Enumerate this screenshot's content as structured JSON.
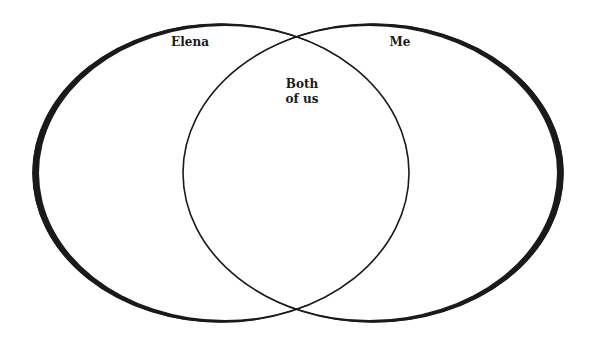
{
  "diagram": {
    "type": "venn",
    "sets": [
      {
        "id": "left",
        "label": "Elena"
      },
      {
        "id": "right",
        "label": "Me"
      }
    ],
    "intersection": {
      "label_line1": "Both",
      "label_line2": "of us"
    },
    "colors": {
      "stroke": "#1a1a1a",
      "background": "#ffffff"
    }
  }
}
